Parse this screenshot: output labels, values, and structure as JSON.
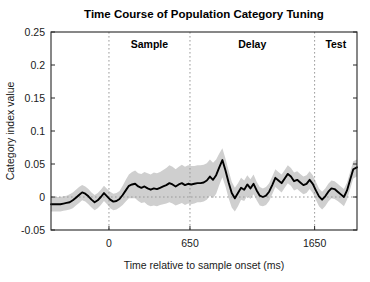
{
  "chart_data": {
    "type": "line",
    "title": "Time Course of Population Category Tuning",
    "xlabel": "Time relative to sample onset  (ms)",
    "ylabel": "Category index value",
    "xlim": [
      -465,
      1990
    ],
    "ylim": [
      -0.05,
      0.25
    ],
    "xticks": [
      0,
      650,
      1650
    ],
    "xtick_labels": [
      "0",
      "650",
      "1650"
    ],
    "yticks": [
      -0.05,
      0,
      0.05,
      0.1,
      0.15,
      0.2,
      0.25
    ],
    "ytick_labels": [
      "-0.05",
      "0",
      "0.05",
      "0.1",
      "0.15",
      "0.2",
      "0.25"
    ],
    "grid": false,
    "legend": "none",
    "zero_reference_line": 0,
    "epoch_markers": [
      {
        "label": "Sample",
        "start": 0,
        "end": 650,
        "line_at": 0
      },
      {
        "label": "Delay",
        "start": 650,
        "end": 1650,
        "line_at": 650
      },
      {
        "label": "Test",
        "start": 1650,
        "end": 1990,
        "line_at": 1650
      }
    ],
    "series": [
      {
        "name": "Category index (mean)",
        "color": "#000000",
        "x": [
          -465,
          -440,
          -415,
          -390,
          -365,
          -340,
          -315,
          -290,
          -265,
          -240,
          -215,
          -190,
          -165,
          -140,
          -115,
          -90,
          -65,
          -40,
          -15,
          10,
          35,
          60,
          85,
          110,
          135,
          160,
          185,
          210,
          235,
          260,
          285,
          310,
          335,
          360,
          385,
          410,
          435,
          460,
          485,
          510,
          535,
          560,
          585,
          610,
          635,
          660,
          685,
          710,
          735,
          760,
          785,
          810,
          835,
          860,
          885,
          910,
          935,
          960,
          985,
          1010,
          1035,
          1060,
          1085,
          1110,
          1135,
          1160,
          1185,
          1210,
          1235,
          1260,
          1285,
          1310,
          1335,
          1360,
          1385,
          1410,
          1435,
          1460,
          1485,
          1510,
          1535,
          1560,
          1585,
          1610,
          1635,
          1660,
          1685,
          1710,
          1735,
          1760,
          1785,
          1810,
          1835,
          1860,
          1885,
          1910,
          1935,
          1960,
          1990
        ],
        "values": [
          -0.011,
          -0.011,
          -0.011,
          -0.011,
          -0.01,
          -0.009,
          -0.008,
          -0.005,
          -0.001,
          0.003,
          0.007,
          0.005,
          0.001,
          -0.004,
          -0.008,
          -0.005,
          0.0,
          0.006,
          0.001,
          -0.004,
          -0.007,
          -0.006,
          -0.003,
          0.003,
          0.01,
          0.017,
          0.019,
          0.02,
          0.016,
          0.014,
          0.016,
          0.013,
          0.011,
          0.013,
          0.012,
          0.014,
          0.016,
          0.018,
          0.021,
          0.019,
          0.016,
          0.019,
          0.021,
          0.018,
          0.02,
          0.019,
          0.02,
          0.021,
          0.021,
          0.022,
          0.025,
          0.031,
          0.026,
          0.033,
          0.045,
          0.056,
          0.04,
          0.022,
          0.006,
          -0.002,
          0.006,
          0.014,
          0.011,
          0.019,
          0.013,
          0.02,
          0.01,
          0.002,
          0.0,
          0.002,
          0.008,
          0.018,
          0.029,
          0.025,
          0.021,
          0.028,
          0.035,
          0.031,
          0.024,
          0.026,
          0.022,
          0.018,
          0.02,
          0.026,
          0.02,
          0.01,
          0.001,
          -0.004,
          0.001,
          0.008,
          0.013,
          0.012,
          0.008,
          0.004,
          0.0,
          0.01,
          0.026,
          0.042,
          0.045
        ]
      }
    ],
    "error_band": {
      "name": "Confidence band",
      "color": "#cccccc",
      "upper": [
        0.0,
        0.0,
        0.0,
        0.0,
        0.001,
        0.002,
        0.004,
        0.007,
        0.011,
        0.015,
        0.018,
        0.016,
        0.012,
        0.007,
        0.003,
        0.006,
        0.011,
        0.017,
        0.012,
        0.008,
        0.005,
        0.006,
        0.009,
        0.017,
        0.026,
        0.034,
        0.038,
        0.04,
        0.036,
        0.035,
        0.038,
        0.036,
        0.034,
        0.037,
        0.036,
        0.038,
        0.041,
        0.044,
        0.048,
        0.046,
        0.042,
        0.046,
        0.049,
        0.046,
        0.048,
        0.047,
        0.047,
        0.048,
        0.048,
        0.049,
        0.051,
        0.057,
        0.052,
        0.057,
        0.066,
        0.074,
        0.058,
        0.04,
        0.023,
        0.014,
        0.021,
        0.029,
        0.025,
        0.033,
        0.027,
        0.034,
        0.023,
        0.015,
        0.013,
        0.015,
        0.021,
        0.031,
        0.042,
        0.038,
        0.034,
        0.041,
        0.048,
        0.044,
        0.037,
        0.039,
        0.035,
        0.031,
        0.033,
        0.039,
        0.033,
        0.023,
        0.013,
        0.008,
        0.013,
        0.02,
        0.025,
        0.024,
        0.02,
        0.016,
        0.012,
        0.022,
        0.038,
        0.054,
        0.057
      ],
      "lower": [
        -0.022,
        -0.022,
        -0.022,
        -0.022,
        -0.021,
        -0.02,
        -0.019,
        -0.017,
        -0.013,
        -0.009,
        -0.005,
        -0.007,
        -0.011,
        -0.016,
        -0.02,
        -0.017,
        -0.012,
        -0.006,
        -0.011,
        -0.017,
        -0.02,
        -0.019,
        -0.016,
        -0.012,
        -0.007,
        -0.002,
        -0.002,
        -0.002,
        -0.006,
        -0.009,
        -0.008,
        -0.012,
        -0.014,
        -0.013,
        -0.014,
        -0.012,
        -0.011,
        -0.01,
        -0.008,
        -0.01,
        -0.013,
        -0.011,
        -0.009,
        -0.012,
        -0.01,
        -0.011,
        -0.01,
        -0.008,
        -0.008,
        -0.007,
        -0.004,
        0.002,
        -0.002,
        0.005,
        0.018,
        0.03,
        0.016,
        -0.002,
        -0.016,
        -0.022,
        -0.014,
        -0.004,
        -0.006,
        0.002,
        -0.003,
        0.004,
        -0.005,
        -0.013,
        -0.014,
        -0.012,
        -0.006,
        0.004,
        0.015,
        0.011,
        0.007,
        0.014,
        0.021,
        0.017,
        0.01,
        0.012,
        0.008,
        0.004,
        0.006,
        0.012,
        0.006,
        -0.004,
        -0.014,
        -0.019,
        -0.014,
        -0.007,
        -0.002,
        -0.003,
        -0.006,
        -0.01,
        -0.014,
        -0.004,
        0.012,
        0.028,
        0.031
      ]
    }
  }
}
